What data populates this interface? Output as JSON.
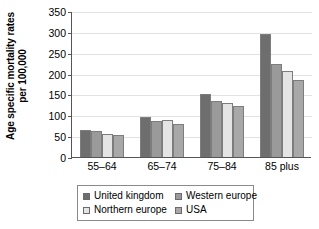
{
  "chart_data": {
    "type": "bar",
    "title": "",
    "xlabel": "",
    "ylabel": "Age specific mortality rates per 100,000",
    "ylabel_line1": "Age specific mortality rates",
    "ylabel_line2": "per 100,000",
    "categories": [
      "55–64",
      "65–74",
      "75–84",
      "85 plus"
    ],
    "ylim": [
      0,
      350
    ],
    "yticks": [
      0,
      50,
      100,
      150,
      200,
      250,
      300,
      350
    ],
    "ytick_labels": [
      "0",
      "50",
      "100",
      "150",
      "200",
      "250",
      "300",
      "350"
    ],
    "grid": true,
    "legend_position": "bottom",
    "series": [
      {
        "name": "United kingdom",
        "color": "#6e6e6e",
        "values": [
          65,
          96,
          151,
          295
        ]
      },
      {
        "name": "Western europe",
        "color": "#9a9a9a",
        "values": [
          62,
          86,
          134,
          223
        ]
      },
      {
        "name": "Northern europe",
        "color": "#e4e4e4",
        "values": [
          55,
          89,
          129,
          206
        ]
      },
      {
        "name": "USA",
        "color": "#a8a8a8",
        "values": [
          52,
          79,
          122,
          185
        ]
      }
    ]
  },
  "legend": {
    "items": [
      {
        "label": "United kingdom",
        "color": "#6e6e6e"
      },
      {
        "label": "Western europe",
        "color": "#9a9a9a"
      },
      {
        "label": "Northern europe",
        "color": "#e4e4e4"
      },
      {
        "label": "USA",
        "color": "#a8a8a8"
      }
    ]
  }
}
